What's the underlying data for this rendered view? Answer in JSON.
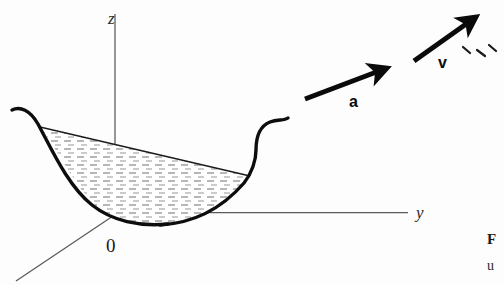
{
  "figure": {
    "background_color": "#fdfdfd",
    "ink_color": "#111111",
    "axis_color": "#555555",
    "hatch_color": "#666666"
  },
  "axes": {
    "vertical": {
      "name": "z-axis",
      "label": "z",
      "style": "italic",
      "from": [
        115,
        218
      ],
      "to": [
        115,
        14
      ]
    },
    "horizontal": {
      "name": "y-axis",
      "label": "y",
      "style": "italic",
      "from": [
        115,
        212
      ],
      "to": [
        408,
        212
      ]
    },
    "depth": {
      "name": "x-axis",
      "label": "",
      "style": "italic",
      "from": [
        115,
        214
      ],
      "to": [
        16,
        281
      ]
    },
    "origin": {
      "label": "0",
      "position": [
        113,
        245
      ]
    }
  },
  "vessel": {
    "name": "parabolic-vessel",
    "stroke_width": 3.4,
    "liquid_surface_left": [
      40,
      127
    ],
    "liquid_surface_right": [
      250,
      176
    ],
    "bottom_center": [
      150,
      224
    ]
  },
  "liquid": {
    "name": "liquid-region",
    "hatch_style": "dashed-horizontal",
    "hatch_row_spacing": 8,
    "hatch_dash": "7 6"
  },
  "vectors": [
    {
      "id": "acceleration",
      "label": "a",
      "tail": [
        305,
        99
      ],
      "head": [
        391,
        66
      ],
      "stroke_width": 5,
      "label_position": [
        352,
        104
      ]
    },
    {
      "id": "velocity",
      "label": "v",
      "tail": [
        414,
        61
      ],
      "head": [
        480,
        14
      ],
      "stroke_width": 5,
      "label_position": [
        441,
        66
      ]
    }
  ],
  "marks": {
    "name": "stray-dash-marks",
    "description": "three short diagonal dashes to the right of the v label",
    "items": [
      [
        464,
        49,
        472,
        54
      ],
      [
        478,
        51,
        486,
        56
      ],
      [
        490,
        47,
        497,
        53
      ]
    ]
  },
  "caption": {
    "name": "figure-caption",
    "bold_fragment": "F",
    "second_line_fragment": "u",
    "bold_position": [
      489,
      243
    ],
    "second_position": [
      489,
      269
    ]
  }
}
